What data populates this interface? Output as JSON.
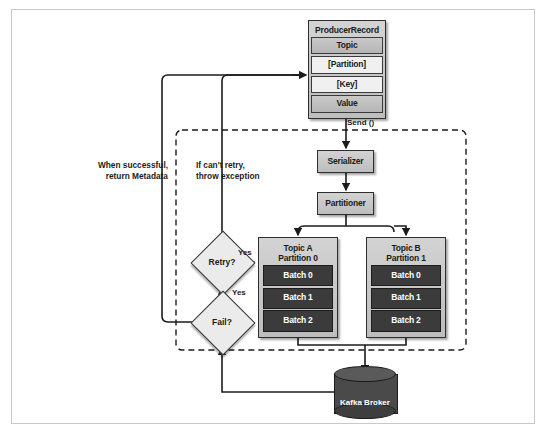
{
  "diagram": {
    "producer_record": {
      "header": "ProducerRecord",
      "fields": [
        {
          "label": "Topic",
          "style": "grey"
        },
        {
          "label": "[Partition]",
          "style": "light"
        },
        {
          "label": "[Key]",
          "style": "light"
        },
        {
          "label": "Value",
          "style": "grey"
        }
      ]
    },
    "stages": [
      {
        "id": "serializer",
        "label": "Serializer"
      },
      {
        "id": "partitioner",
        "label": "Partitioner"
      }
    ],
    "topics": [
      {
        "id": "topic-a",
        "title_line1": "Topic A",
        "title_line2": "Partition 0",
        "batches": [
          "Batch 0",
          "Batch 1",
          "Batch 2"
        ]
      },
      {
        "id": "topic-b",
        "title_line1": "Topic B",
        "title_line2": "Partition 1",
        "batches": [
          "Batch 0",
          "Batch 1",
          "Batch 2"
        ]
      }
    ],
    "decisions": [
      {
        "id": "retry",
        "label": "Retry?"
      },
      {
        "id": "fail",
        "label": "Fail?"
      }
    ],
    "edge_labels": {
      "send": "Send ()",
      "yes_retry": "Yes",
      "yes_fail": "Yes"
    },
    "annotations": {
      "success": "When successful,\nreturn Metadata",
      "exception": "If can't retry,\nthrow exception"
    },
    "broker": {
      "label": "Kafka Broker"
    },
    "colors": {
      "node_fill": "#c9c9c9",
      "node_stroke": "#2e2e2e",
      "batch_fill": "#3b3b3b",
      "broker_fill": "#4a4a4a",
      "frame_stroke": "#c9c9c9",
      "line_stroke": "#1b1b1b"
    }
  }
}
